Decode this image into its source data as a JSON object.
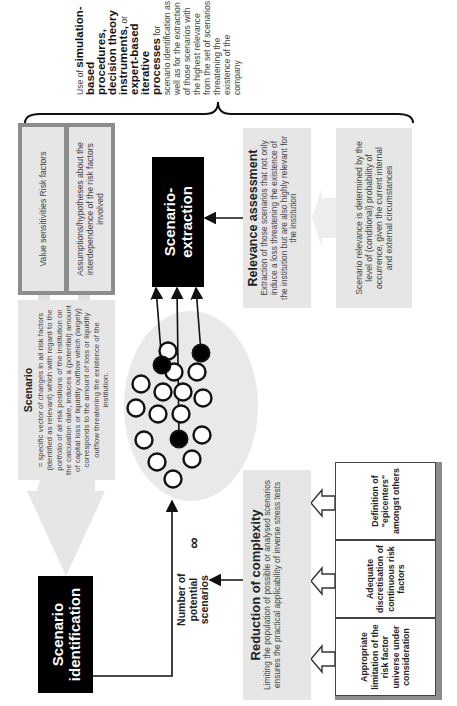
{
  "intro": {
    "lead": "Use of",
    "bold1": "simulation-based procedures, decision theory instruments,",
    "mid": "or",
    "bold2": "expert-based iterative processes",
    "tail": "for scenario identification as well as for the extraction of those scenarios with the highest relevance from the set of scenarios threatening the existence of the company"
  },
  "inputs_panel": {
    "item1": "Value sensitivities Risk factors",
    "item2": "Assumptions/hypotheses about the interdependence of the risk factors involved"
  },
  "scenario_def": {
    "title": "Scenario",
    "text": "= specific vector of changes in all risk factors (identified as relevant) which with regard to the portfolio of all risk positions of the institution on the calculation date, induces a (potential) amount of capital loss or liquidity outflow which (largely) corresponds to the amount of loss or liquidity outflow threatening the existence of the institution."
  },
  "scenario_identification": {
    "label": "Scenario identification"
  },
  "scenario_extraction": {
    "label": "Scenario-extraction"
  },
  "relevance": {
    "title": "Relevance assessment",
    "text": "Extraction of those scenarios that not only induce a loss threatening the existence of the institution but are also highly relevant for the institution",
    "detail": "Scenario relevance is determined by the level of (conditional) probability of occurrence, given the current internal and external circumstances"
  },
  "potential": {
    "label": "Number of potential scenarios",
    "symbol": "∞"
  },
  "reduction": {
    "title": "Reduction of complexity",
    "text": "Limiting the population of possible or analysed scenarios ensures the practical applicability of inverse stress tests",
    "measures": [
      "Appropriate limitation of the risk factor universe under consideration",
      "Adequate discretisation of continuous risk factors",
      "Definition of \"epicenters\" amongst others"
    ]
  },
  "colors": {
    "box_fill": "#e6e6e6",
    "panel_border": "#8c8c8c",
    "black": "#000000",
    "circle_fill_selected": "#000000",
    "circle_fill": "#ffffff"
  }
}
